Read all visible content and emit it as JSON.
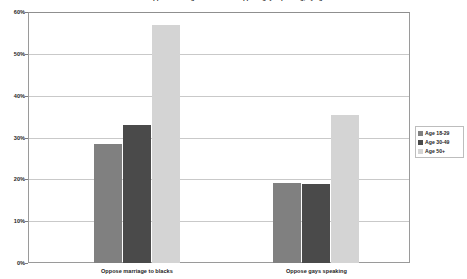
{
  "chart_data": {
    "type": "bar",
    "title": "Percent who oppose marriage to blacks and oppose gays speaking, by age",
    "xlabel": "",
    "ylabel": "",
    "categories": [
      "Oppose marriage to blacks",
      "Oppose gays speaking"
    ],
    "series": [
      {
        "name": "Age 18-29",
        "color": "#808080",
        "values": [
          28.5,
          19.2
        ]
      },
      {
        "name": "Age 30-49",
        "color": "#4a4a4a",
        "values": [
          33.0,
          18.8
        ]
      },
      {
        "name": "Age 50+",
        "color": "#d4d4d4",
        "values": [
          56.8,
          35.3
        ]
      }
    ],
    "ylim": [
      0,
      60
    ],
    "ytick_labels": [
      "0%",
      "10%",
      "20%",
      "30%",
      "40%",
      "50%",
      "60%"
    ],
    "ytick_values": [
      0,
      10,
      20,
      30,
      40,
      50,
      60
    ],
    "grid": true,
    "legend_position": "right"
  },
  "legend": {
    "entries": [
      "Age 18-29",
      "Age 30-49",
      "Age 50+"
    ]
  },
  "axis": {
    "y_labels": [
      "60%",
      "50%",
      "40%",
      "30%",
      "20%",
      "10%",
      "0%"
    ]
  },
  "categories": {
    "first": "Oppose marriage to blacks",
    "second": "Oppose gays speaking"
  }
}
